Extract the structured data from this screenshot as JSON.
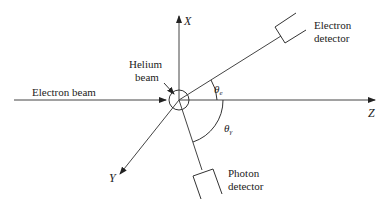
{
  "diagram": {
    "type": "scattering-geometry",
    "labels": {
      "electron_beam": "Electron beam",
      "helium_beam_line1": "Helium",
      "helium_beam_line2": "beam",
      "electron_detector_line1": "Electron",
      "electron_detector_line2": "detector",
      "photon_detector_line1": "Photon",
      "photon_detector_line2": "detector"
    },
    "axes": {
      "x": "X",
      "y": "Y",
      "z": "Z"
    },
    "angles": {
      "theta_e": "θ",
      "theta_e_sub": "e",
      "theta_gamma": "θ",
      "theta_gamma_sub": "γ"
    },
    "colors": {
      "line": "#333333",
      "background": "#ffffff"
    }
  }
}
